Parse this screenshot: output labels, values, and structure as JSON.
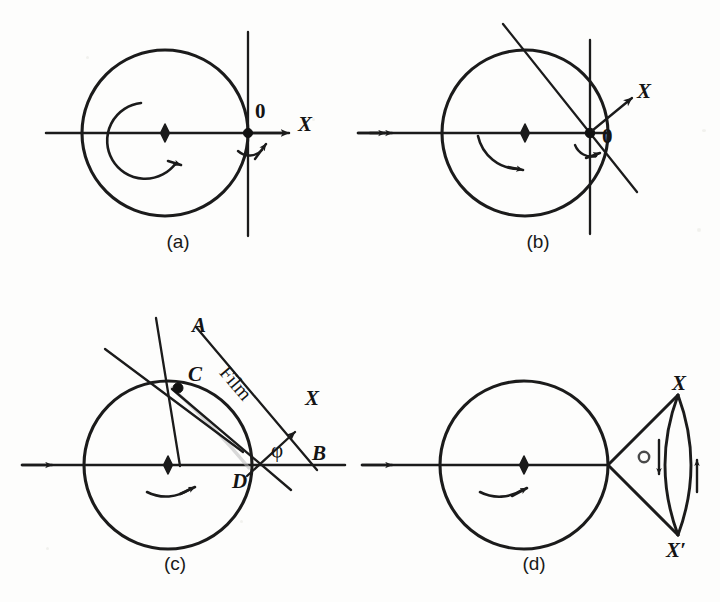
{
  "figure": {
    "caption_panels": [
      "(a)",
      "(b)",
      "(c)",
      "(d)"
    ],
    "background_color": "#fdfdfc",
    "ink_color": "#1b1b1b"
  },
  "panel_a": {
    "label": "(a)",
    "origin_label": "0",
    "axis_label": "X",
    "center": [
      165,
      133
    ],
    "radius": 83,
    "has_rotation_arrow": true,
    "has_center_diamond": true,
    "has_origin_dot": true,
    "has_vertical_film_line": true
  },
  "panel_b": {
    "label": "(b)",
    "origin_label": "0",
    "axis_label": "X",
    "center": [
      525,
      133
    ],
    "radius": 83,
    "has_rotation_arrow": true,
    "has_center_diamond": true,
    "has_origin_dot": true,
    "has_vertical_film_line": true,
    "has_tilted_film_line": true,
    "beam_arrowheads": 2
  },
  "panel_c": {
    "label": "(c)",
    "center": [
      168,
      465
    ],
    "radius": 84,
    "point_a_label": "A",
    "point_b_label": "B",
    "point_c_label": "C",
    "point_d_label": "D",
    "film_label": "Film",
    "axis_label": "X",
    "angle_label": "φ",
    "has_rotation_arrow": true,
    "has_center_diamond": true,
    "beam_arrowheads": 1
  },
  "panel_d": {
    "label": "(d)",
    "center": [
      524,
      465
    ],
    "radius": 84,
    "upper_label": "X",
    "lower_label": "X′",
    "cone_angle_label": "σ",
    "has_rotation_arrow": true,
    "has_center_diamond": true,
    "beam_arrowheads": 1,
    "has_lens_arrows": true
  }
}
